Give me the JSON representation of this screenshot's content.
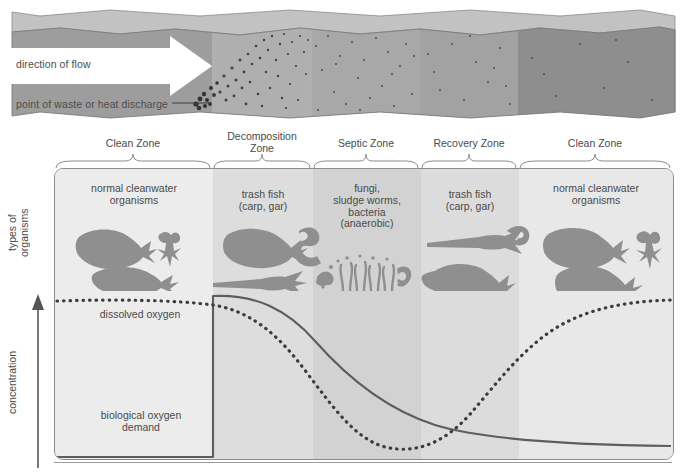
{
  "figure": {
    "stream": {
      "flow_label": "direction of flow",
      "discharge_label": "point of waste or heat discharge"
    },
    "zones": [
      {
        "name": "clean-zone-left",
        "label": "Clean Zone",
        "x": 54,
        "width": 158
      },
      {
        "name": "decomposition-zone",
        "label": "Decomposition\nZone",
        "x": 212,
        "width": 100
      },
      {
        "name": "septic-zone",
        "label": "Septic Zone",
        "x": 312,
        "width": 108
      },
      {
        "name": "recovery-zone",
        "label": "Recovery Zone",
        "x": 420,
        "width": 98
      },
      {
        "name": "clean-zone-right",
        "label": "Clean Zone",
        "x": 518,
        "width": 154
      }
    ],
    "organisms": [
      {
        "zone": "clean-zone-left",
        "label": "normal cleanwater\norganisms"
      },
      {
        "zone": "decomposition-zone",
        "label": "trash fish\n(carp, gar)"
      },
      {
        "zone": "septic-zone",
        "label": "fungi,\nsludge worms,\nbacteria\n(anaerobic)"
      },
      {
        "zone": "recovery-zone",
        "label": "trash fish\n(carp, gar)"
      },
      {
        "zone": "clean-zone-right",
        "label": "normal cleanwater\norganisms"
      }
    ],
    "axes": {
      "organisms_axis_label": "types of\norganisms",
      "concentration_axis_label": "concentration"
    },
    "curves": [
      {
        "name": "dissolved-oxygen",
        "label": "dissolved oxygen",
        "style": "dotted"
      },
      {
        "name": "biological-oxygen-demand",
        "label": "biological oxygen\ndemand",
        "style": "solid"
      }
    ],
    "colors": {
      "water": "#9a9a9a",
      "water_top": "#b4b4b4",
      "panel_bg": "#ececec",
      "ink": "#4a4a4a",
      "organism_fill": "#8f8f8f",
      "curve": "#5a5a5a"
    }
  }
}
